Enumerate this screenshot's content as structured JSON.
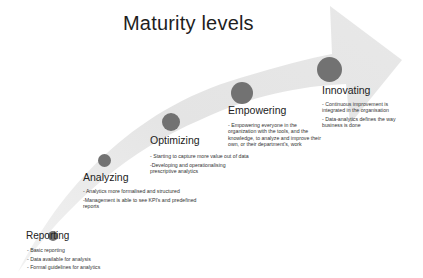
{
  "title": "Maturity levels",
  "colors": {
    "arrow": "#e6e6e6",
    "dot": "#727272",
    "text": "#222222"
  },
  "stages": [
    {
      "name": "Reporting",
      "bullets": [
        "- Basic reporting",
        "- Data available for analysis",
        "- Formal guidelines for analytics"
      ]
    },
    {
      "name": "Analyzing",
      "bullets": [
        "- Analytics more formalised and structured",
        "-Management is able to see KPI's and predefined reports"
      ]
    },
    {
      "name": "Optimizing",
      "bullets": [
        "- Starting to capture more value out of data",
        "-Developing and operationalising prescriptive analytics"
      ]
    },
    {
      "name": "Empowering",
      "bullets": [
        "- Empowering everyone in the organization with the tools, and the knowledge, to analyze and improve their own, or their department's, work"
      ]
    },
    {
      "name": "Innovating",
      "bullets": [
        "- Continuous improvement is integrated in the organisation",
        "- Data-analytics defines the way business is done"
      ]
    }
  ]
}
